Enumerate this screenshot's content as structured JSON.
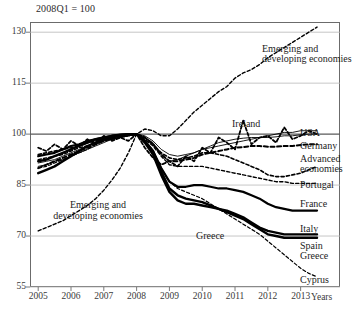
{
  "chart_data": {
    "type": "line",
    "title": "2008Q1 = 100",
    "xlabel": "Years",
    "ylabel": "",
    "xlim": [
      2004.75,
      2014.2
    ],
    "ylim": [
      55,
      133
    ],
    "grid": true,
    "legend_position": "right-of-plot (direct series labels)",
    "x_ticks": [
      "2005",
      "2006",
      "2007",
      "2008",
      "2009",
      "2010",
      "2011",
      "2012",
      "2013"
    ],
    "y_ticks": [
      "55",
      "70",
      "85",
      "100",
      "115",
      "130"
    ],
    "x": [
      2005.0,
      2005.25,
      2005.5,
      2005.75,
      2006.0,
      2006.25,
      2006.5,
      2006.75,
      2007.0,
      2007.25,
      2007.5,
      2007.75,
      2008.0,
      2008.25,
      2008.5,
      2008.75,
      2009.0,
      2009.25,
      2009.5,
      2009.75,
      2010.0,
      2010.25,
      2010.5,
      2010.75,
      2011.0,
      2011.25,
      2011.5,
      2011.75,
      2012.0,
      2012.25,
      2012.5,
      2012.75,
      2013.0,
      2013.25,
      2013.5
    ],
    "annotations": [
      {
        "text": "Emerging and developing economies",
        "x": 2006.6,
        "y": 78.5
      },
      {
        "text": "Greece",
        "x": 2011.0,
        "y": 71.5
      }
    ],
    "series": [
      {
        "name": "Emerging and developing economies",
        "style": "dashed",
        "width": 1.4,
        "label_right": "Emerging and\ndeveloping economies",
        "values": [
          71.5,
          72.5,
          73.5,
          74.5,
          76.0,
          77.5,
          79.0,
          81.0,
          83.5,
          86.5,
          90.0,
          94.5,
          100.0,
          101.5,
          101.0,
          99.5,
          99.5,
          101.5,
          104.0,
          106.5,
          108.5,
          110.5,
          112.5,
          114.0,
          116.5,
          118.0,
          119.0,
          120.5,
          122.5,
          124.0,
          125.5,
          127.0,
          128.5,
          130.0,
          131.5
        ]
      },
      {
        "name": "Ireland",
        "style": "dashed",
        "width": 1.8,
        "label_right": "Ireland",
        "values": [
          96.0,
          95.0,
          97.0,
          95.5,
          98.0,
          96.5,
          98.5,
          97.0,
          99.5,
          98.0,
          99.0,
          98.0,
          100.0,
          96.0,
          93.0,
          91.0,
          92.0,
          90.5,
          93.5,
          92.0,
          96.0,
          94.5,
          99.0,
          97.5,
          95.5,
          104.0,
          97.0,
          99.0,
          99.5,
          97.5,
          102.0,
          98.5,
          99.5,
          101.0,
          100.0
        ]
      },
      {
        "name": "USA",
        "style": "solid",
        "width": 0.9,
        "label_right": "USA",
        "values": [
          90.5,
          91.0,
          92.0,
          92.5,
          93.5,
          94.5,
          95.5,
          96.5,
          97.5,
          98.5,
          99.0,
          99.5,
          100.0,
          99.5,
          98.0,
          95.5,
          94.0,
          93.5,
          94.0,
          94.5,
          95.5,
          96.0,
          96.5,
          97.0,
          97.5,
          98.0,
          98.5,
          99.0,
          99.5,
          100.0,
          100.5,
          100.5,
          101.0,
          101.0,
          101.0
        ]
      },
      {
        "name": "Germany",
        "style": "solid",
        "width": 0.9,
        "label_right": "Germany",
        "values": [
          91.5,
          92.0,
          92.5,
          93.5,
          94.5,
          95.5,
          96.5,
          97.5,
          98.5,
          99.0,
          99.5,
          99.8,
          100.0,
          99.0,
          97.5,
          94.0,
          92.0,
          92.5,
          93.5,
          94.5,
          95.5,
          96.5,
          97.5,
          98.0,
          98.5,
          98.8,
          99.0,
          99.0,
          99.0,
          99.2,
          99.5,
          99.5,
          99.8,
          100.0,
          100.0
        ]
      },
      {
        "name": "Advanced economies",
        "style": "dashed",
        "width": 2.0,
        "label_right": "Advanced\neconomies",
        "values": [
          90.0,
          91.0,
          92.0,
          93.0,
          94.0,
          95.0,
          96.0,
          97.0,
          98.0,
          98.8,
          99.3,
          99.7,
          100.0,
          99.0,
          97.0,
          94.0,
          92.0,
          92.0,
          92.5,
          93.0,
          94.0,
          94.5,
          95.0,
          95.5,
          96.0,
          96.2,
          96.5,
          96.5,
          96.3,
          96.3,
          96.5,
          96.5,
          96.8,
          97.0,
          97.0
        ]
      },
      {
        "name": "Portugal",
        "style": "dashed",
        "width": 1.6,
        "label_right": "Portugal",
        "values": [
          94.0,
          94.5,
          95.0,
          95.5,
          96.0,
          96.5,
          97.5,
          98.0,
          98.5,
          99.0,
          99.5,
          99.8,
          100.0,
          99.0,
          97.0,
          94.5,
          93.0,
          92.5,
          93.0,
          93.5,
          94.5,
          94.5,
          94.0,
          93.5,
          92.5,
          91.5,
          90.5,
          89.5,
          88.0,
          87.5,
          87.5,
          88.0,
          88.5,
          89.5,
          90.5
        ]
      },
      {
        "name": "France",
        "style": "dashed",
        "width": 1.4,
        "label_right": "France",
        "values": [
          92.5,
          93.0,
          93.5,
          94.0,
          95.0,
          96.0,
          96.5,
          97.5,
          98.0,
          98.5,
          99.0,
          99.5,
          100.0,
          98.5,
          96.5,
          93.5,
          91.0,
          90.5,
          90.5,
          90.5,
          90.5,
          90.0,
          89.5,
          89.0,
          88.5,
          88.0,
          87.5,
          87.0,
          86.5,
          86.0,
          86.0,
          85.5,
          85.5,
          85.5,
          85.5
        ]
      },
      {
        "name": "Italy",
        "style": "solid",
        "width": 2.2,
        "label_right": "Italy",
        "values": [
          93.5,
          94.0,
          94.5,
          95.5,
          96.5,
          97.0,
          98.0,
          98.5,
          99.0,
          99.5,
          99.8,
          100.0,
          100.0,
          98.0,
          95.0,
          90.0,
          86.0,
          84.5,
          84.5,
          85.0,
          85.0,
          84.5,
          84.0,
          84.0,
          83.5,
          83.0,
          82.0,
          81.0,
          79.5,
          78.5,
          78.0,
          77.5,
          77.5,
          77.5,
          77.5
        ]
      },
      {
        "name": "Spain",
        "style": "solid",
        "width": 2.4,
        "label_right": "Spain",
        "values": [
          92.0,
          92.5,
          93.5,
          94.5,
          95.5,
          96.5,
          97.5,
          98.5,
          99.0,
          99.5,
          99.8,
          100.0,
          100.0,
          97.5,
          94.0,
          88.0,
          83.0,
          80.5,
          79.5,
          79.5,
          79.0,
          78.5,
          78.0,
          77.5,
          76.5,
          75.5,
          74.0,
          72.5,
          71.5,
          71.0,
          70.5,
          70.5,
          70.5,
          70.5,
          70.5
        ]
      },
      {
        "name": "Greece",
        "style": "solid",
        "width": 2.4,
        "label_right": "Greece",
        "values": [
          88.5,
          89.5,
          90.5,
          92.0,
          93.5,
          95.0,
          96.5,
          97.5,
          98.5,
          99.0,
          99.5,
          99.8,
          100.0,
          98.0,
          95.0,
          89.0,
          84.0,
          82.0,
          81.0,
          80.5,
          80.0,
          79.0,
          78.0,
          77.0,
          76.0,
          75.0,
          73.5,
          72.0,
          70.5,
          70.0,
          69.5,
          69.5,
          69.5,
          69.5,
          69.5
        ]
      },
      {
        "name": "Cyprus",
        "style": "dashed",
        "width": 1.2,
        "label_right": "Cyprus",
        "values": [
          90.0,
          90.5,
          91.5,
          92.5,
          93.5,
          94.5,
          95.5,
          97.0,
          98.0,
          98.5,
          99.0,
          99.5,
          100.0,
          98.0,
          95.0,
          90.0,
          86.0,
          84.0,
          83.0,
          82.0,
          81.0,
          79.5,
          78.0,
          76.5,
          75.0,
          73.5,
          72.0,
          70.5,
          68.5,
          66.5,
          64.5,
          62.5,
          60.5,
          59.0,
          58.0
        ]
      }
    ]
  },
  "axis": {
    "y_ticks": [
      {
        "label": "130",
        "value": 130
      },
      {
        "label": "115",
        "value": 115
      },
      {
        "label": "100",
        "value": 100
      },
      {
        "label": "85",
        "value": 85
      },
      {
        "label": "70",
        "value": 70
      },
      {
        "label": "55",
        "value": 55
      }
    ],
    "x_ticks": [
      {
        "label": "2005",
        "value": 2005
      },
      {
        "label": "2006",
        "value": 2006
      },
      {
        "label": "2007",
        "value": 2007
      },
      {
        "label": "2008",
        "value": 2008
      },
      {
        "label": "2009",
        "value": 2009
      },
      {
        "label": "2010",
        "value": 2010
      },
      {
        "label": "2011",
        "value": 2011
      },
      {
        "label": "2012",
        "value": 2012
      },
      {
        "label": "2013",
        "value": 2013
      }
    ],
    "x_axis_title": "Years"
  },
  "series_labels": {
    "emerging_line1": "Emerging and",
    "emerging_line2": "developing economies",
    "ireland": "Ireland",
    "usa": "USA",
    "germany": "Germany",
    "advanced_line1": "Advanced",
    "advanced_line2": "economies",
    "portugal": "Portugal",
    "france": "France",
    "italy": "Italy",
    "spain": "Spain",
    "greece": "Greece",
    "cyprus": "Cyprus"
  },
  "in_plot_annotations": {
    "emerging_line1": "Emerging and",
    "emerging_line2": "developing economies",
    "greece": "Greece"
  },
  "colors": {
    "line": "#000000",
    "grid": "#b8b8b8",
    "emphasis_grid": "#5a5a5a",
    "frame": "#6b6b6b",
    "text": "#1c1c1c"
  }
}
